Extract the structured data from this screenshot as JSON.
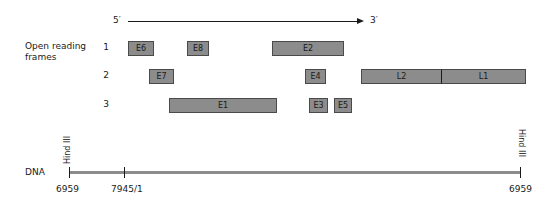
{
  "direction": {
    "five_prime": "5′",
    "three_prime": "3′"
  },
  "orf_title": "Open reading frames",
  "orf_title_lines": [
    "Open reading",
    "frames"
  ],
  "frames": [
    {
      "number": "1",
      "genes": [
        {
          "label": "E6",
          "x": 128,
          "w": 26
        },
        {
          "label": "E8",
          "x": 187,
          "w": 22
        },
        {
          "label": "E2",
          "x": 272,
          "w": 72
        }
      ]
    },
    {
      "number": "2",
      "genes": [
        {
          "label": "E7",
          "x": 149,
          "w": 25
        },
        {
          "label": "E4",
          "x": 305,
          "w": 21
        },
        {
          "label": "L2",
          "x": 361,
          "w": 80
        },
        {
          "label": "L1",
          "x": 441,
          "w": 85
        }
      ]
    },
    {
      "number": "3",
      "genes": [
        {
          "label": "E1",
          "x": 169,
          "w": 108
        },
        {
          "label": "E3",
          "x": 309,
          "w": 19
        },
        {
          "label": "E5",
          "x": 334,
          "w": 18
        }
      ]
    }
  ],
  "dna": {
    "label": "DNA",
    "restriction_site": "Hind III",
    "positions": [
      "6959",
      "7945/1",
      "6959"
    ]
  },
  "colors": {
    "orf_fill": "#8c8c8c",
    "orf_border": "#4a4a4a",
    "dna_line": "#8c8c8c",
    "text": "#1a1a1a"
  }
}
